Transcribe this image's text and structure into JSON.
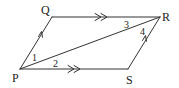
{
  "diagram": {
    "type": "parallelogram",
    "stroke_color": "#333333",
    "vertices": {
      "P": {
        "label": "P",
        "x": 20,
        "y": 69
      },
      "Q": {
        "label": "Q",
        "x": 52,
        "y": 17
      },
      "R": {
        "label": "R",
        "x": 160,
        "y": 17
      },
      "S": {
        "label": "S",
        "x": 128,
        "y": 69
      }
    },
    "edges": [
      {
        "from": "P",
        "to": "Q",
        "marker": "single-arrow"
      },
      {
        "from": "Q",
        "to": "R",
        "marker": "double-arrow"
      },
      {
        "from": "P",
        "to": "S",
        "marker": "double-arrow"
      },
      {
        "from": "S",
        "to": "R",
        "marker": "single-arrow"
      },
      {
        "from": "P",
        "to": "R",
        "marker": "none"
      }
    ],
    "angles": [
      {
        "label": "1",
        "at": "P",
        "between": "PQ and PR"
      },
      {
        "label": "2",
        "at": "P",
        "between": "PR and PS"
      },
      {
        "label": "3",
        "at": "R",
        "between": "RQ and RP"
      },
      {
        "label": "4",
        "at": "R",
        "between": "RP and RS"
      }
    ]
  }
}
